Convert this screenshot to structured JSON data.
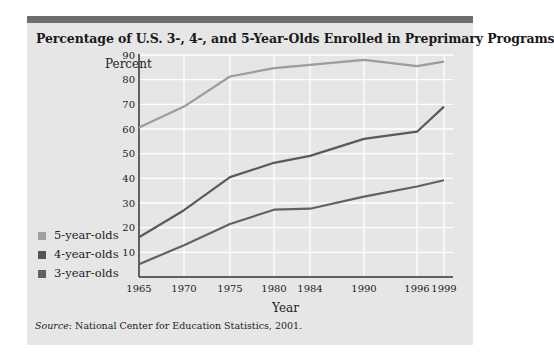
{
  "chart_data": {
    "type": "line",
    "title": "Percentage of U.S. 3-, 4-, and 5-Year-Olds Enrolled in Preprimary Programs",
    "xlabel": "Year",
    "ylabel": "Percent",
    "x": [
      1965,
      1970,
      1975,
      1980,
      1984,
      1990,
      1996,
      1999
    ],
    "x_tick_labels": [
      "1965",
      "1970",
      "1975",
      "1980",
      "1984",
      "1990",
      "1996",
      "1999"
    ],
    "y_ticks": [
      10,
      20,
      30,
      40,
      50,
      60,
      70,
      80,
      90
    ],
    "ylim": [
      0,
      90
    ],
    "grid": true,
    "legend_position": "left",
    "series": [
      {
        "name": "5-year-olds",
        "color": "#9c9c9c",
        "values": [
          60.6,
          69.1,
          81.3,
          84.7,
          86.0,
          88.0,
          85.5,
          87.3
        ]
      },
      {
        "name": "4-year-olds",
        "color": "#5a5a5a",
        "values": [
          16.1,
          27.1,
          40.5,
          46.3,
          49.1,
          56.0,
          58.9,
          69.1
        ]
      },
      {
        "name": "3-year-olds",
        "color": "#626262",
        "values": [
          5.2,
          12.9,
          21.5,
          27.3,
          27.7,
          32.6,
          36.7,
          39.2
        ]
      }
    ],
    "source": "Source: National Center for Education Statistics, 2001."
  },
  "title": "Percentage of U.S. 3-, 4-, and 5-Year-Olds Enrolled in Preprimary Programs",
  "axis": {
    "y_label": "Percent",
    "x_label": "Year"
  },
  "legend": [
    {
      "label": "5-year-olds",
      "color": "#a0a0a0"
    },
    {
      "label": "4-year-olds",
      "color": "#555555"
    },
    {
      "label": "3-year-olds",
      "color": "#606060"
    }
  ],
  "source": {
    "prefix": "Source",
    "text": ": National Center for Education Statistics, 2001."
  },
  "colors": {
    "panel": "#e6e6e6",
    "topbar": "#6e6e6e",
    "grid": "#ffffff",
    "axis": "#333333"
  }
}
